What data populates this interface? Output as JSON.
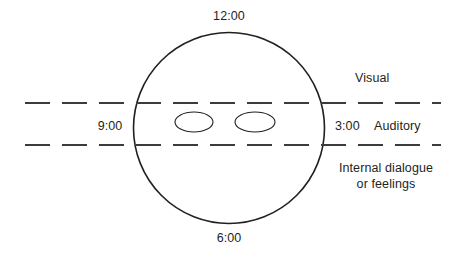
{
  "diagram": {
    "background_color": "#ffffff",
    "stroke_color": "#231f20",
    "dash_color": "#3c3c3c",
    "text_color": "#231f20"
  },
  "clock_labels": {
    "twelve": "12:00",
    "six": "6:00",
    "nine": "9:00",
    "three": "3:00"
  },
  "zone_labels": {
    "visual": "Visual",
    "auditory": "Auditory",
    "internal_line1": "Internal dialogue",
    "internal_line2": "or feelings"
  },
  "shapes": {
    "circle": {
      "cx": 229,
      "cy": 128,
      "r": 95.5,
      "stroke_width": 1.6
    },
    "eye_left": {
      "cx": 194,
      "cy": 122,
      "rx": 19,
      "ry": 10,
      "stroke_width": 1.1
    },
    "eye_right": {
      "cx": 255,
      "cy": 122,
      "rx": 20,
      "ry": 10,
      "stroke_width": 1.1
    },
    "dashed_line_top": {
      "x1": 25,
      "y1": 103,
      "x2": 441,
      "y2": 103,
      "stroke_width": 2.1,
      "dash": "25 12"
    },
    "dashed_line_bottom": {
      "x1": 25,
      "y1": 145,
      "x2": 441,
      "y2": 145,
      "stroke_width": 2.1,
      "dash": "25 12"
    }
  }
}
